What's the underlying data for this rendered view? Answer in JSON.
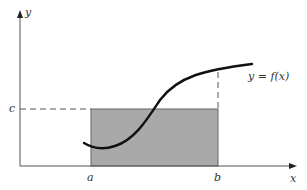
{
  "figure": {
    "axes": {
      "x_label": "x",
      "y_label": "y"
    },
    "ticks": {
      "a_label": "a",
      "b_label": "b",
      "c_label": "c"
    },
    "curve_label": "y = f(x)",
    "colors": {
      "axis": "#555555",
      "curve": "#111111",
      "rectangle_fill": "#a9a9a9",
      "rectangle_stroke": "#666666",
      "dashed": "#555555"
    }
  }
}
